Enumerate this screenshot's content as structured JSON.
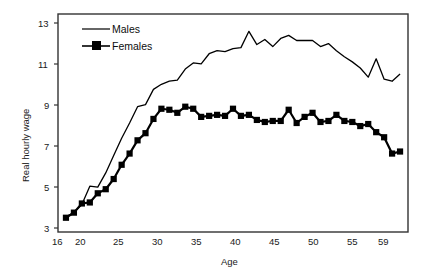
{
  "chart_data": {
    "type": "line",
    "title": "",
    "xlabel": "Age",
    "ylabel": "Real hourly wage",
    "xlim": [
      16,
      60
    ],
    "ylim": [
      3,
      13.7
    ],
    "xticks": [
      16,
      20,
      25,
      30,
      35,
      40,
      45,
      50,
      55,
      59
    ],
    "xtick_labels": [
      "16",
      "20",
      "25",
      "30",
      "35",
      "40",
      "45",
      "50",
      "55",
      "59"
    ],
    "yticks": [
      3,
      5,
      7,
      9,
      11,
      13
    ],
    "ytick_labels": [
      "3",
      "5",
      "7",
      "9",
      "11",
      "13"
    ],
    "grid": false,
    "legend_position": "top-left",
    "x": [
      17,
      18,
      19,
      20,
      21,
      22,
      23,
      24,
      25,
      26,
      27,
      28,
      29,
      30,
      31,
      32,
      33,
      34,
      35,
      36,
      37,
      38,
      39,
      40,
      41,
      42,
      43,
      44,
      45,
      46,
      47,
      48,
      49,
      50,
      51,
      52,
      53,
      54,
      55,
      56,
      57,
      58,
      59
    ],
    "series": [
      {
        "name": "Males",
        "marker": "none",
        "color": "#000000",
        "values": [
          3.75,
          3.95,
          4.35,
          5.25,
          5.2,
          5.9,
          6.75,
          7.6,
          8.35,
          9.15,
          9.25,
          10.0,
          10.25,
          10.4,
          10.45,
          11.0,
          11.3,
          11.25,
          11.75,
          11.9,
          11.85,
          12.0,
          12.05,
          12.85,
          12.2,
          12.45,
          12.1,
          12.5,
          12.65,
          12.4,
          12.4,
          12.4,
          12.1,
          12.25,
          11.9,
          11.6,
          11.35,
          11.05,
          10.6,
          11.5,
          10.5,
          10.4,
          10.75
        ]
      },
      {
        "name": "Females",
        "marker": "square",
        "color": "#000000",
        "values": [
          3.7,
          3.95,
          4.4,
          4.45,
          4.9,
          5.1,
          5.6,
          6.3,
          6.85,
          7.5,
          7.85,
          8.55,
          9.05,
          9.0,
          8.85,
          9.15,
          9.05,
          8.65,
          8.7,
          8.75,
          8.7,
          9.05,
          8.7,
          8.75,
          8.5,
          8.4,
          8.45,
          8.45,
          9.0,
          8.35,
          8.65,
          8.85,
          8.4,
          8.45,
          8.75,
          8.45,
          8.4,
          8.2,
          8.3,
          7.9,
          7.65,
          6.85,
          6.95
        ]
      }
    ]
  },
  "legend": {
    "entries": [
      {
        "label": "Males"
      },
      {
        "label": "Females"
      }
    ]
  }
}
